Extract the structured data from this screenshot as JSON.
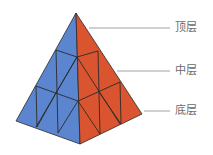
{
  "diagram": {
    "colors": {
      "left_face": "#5b86cf",
      "right_face": "#d9542f",
      "edges": "#2a2a2a",
      "leader_line": "#8a8a8a"
    },
    "labels": [
      {
        "text": "顶层",
        "y": 22
      },
      {
        "text": "中层",
        "y": 65
      },
      {
        "text": "底层",
        "y": 105
      }
    ]
  }
}
